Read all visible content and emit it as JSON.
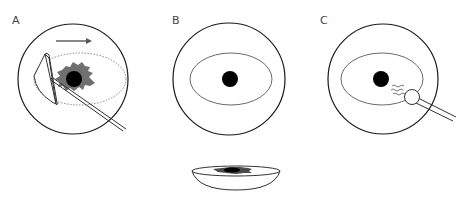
{
  "figure": {
    "panels": [
      {
        "label": "A",
        "description": "Dish circle with dotted ellipse, dark gray irregular tissue, black nucleus, movement arrow pointing right, and two instruments (triangular spatula and straight needle) entering from lower right"
      },
      {
        "label": "B",
        "description": "Dish circle with solid ellipse outline and central black nucleus"
      },
      {
        "label": "C",
        "description": "Dish circle with solid ellipse outline, central black nucleus, and probe with round tip emitting wavy lines toward nucleus"
      }
    ],
    "side_view": {
      "description": "Side view of shallow bowl-shaped dish with dark tissue inside"
    },
    "colors": {
      "outline": "#1a1a1a",
      "ellipse": "#6b6b6b",
      "tissue": "#707070",
      "nucleus": "#000000",
      "arrow": "#555555"
    }
  }
}
